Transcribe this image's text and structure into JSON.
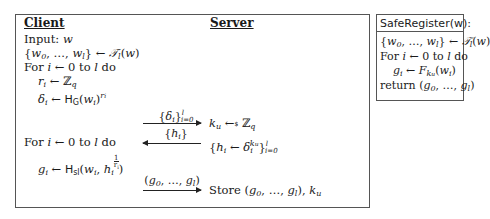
{
  "protocol": {
    "client_header": "Client",
    "server_header": "Server",
    "client_steps": [
      "Input: w",
      "{w₀, …, wₗ} ← 𝒯ₗ(w)",
      "For i ← 0 to l do",
      "rᵢ ← ℤq",
      "δᵢ ← H_G(wᵢ)^rᵢ",
      "For i ← 0 to l do",
      "gᵢ ← H_sl(wᵢ, hᵢ^(1/rᵢ))"
    ],
    "messages": [
      {
        "label": "{δᵢ} i=0..l",
        "direction": "right"
      },
      {
        "label": "{hᵢ}",
        "direction": "left"
      },
      {
        "label": "(g₀, …, gₗ)",
        "direction": "right"
      }
    ],
    "server_steps": [
      "kᵤ ←$ ℤq",
      "{hᵢ ← δᵢ^kᵤ} i=0..l",
      "Store (g₀, …, gₗ), kᵤ"
    ]
  },
  "safe_register": {
    "title": "SafeRegister(w):",
    "steps": [
      "{w₀, …, wₗ} ← 𝒯ₗ(w)",
      "For i ← 0 to l do",
      "gᵢ ← F_kᵤ(wᵢ)",
      "return (g₀, …, gₗ)"
    ]
  },
  "text": {
    "input_label": "Input: ",
    "for_label": "For ",
    "to_label": " to ",
    "do_label": " do",
    "store_label": "Store ",
    "return_label": "return ",
    "arrow_left": "←",
    "zero": "0"
  }
}
